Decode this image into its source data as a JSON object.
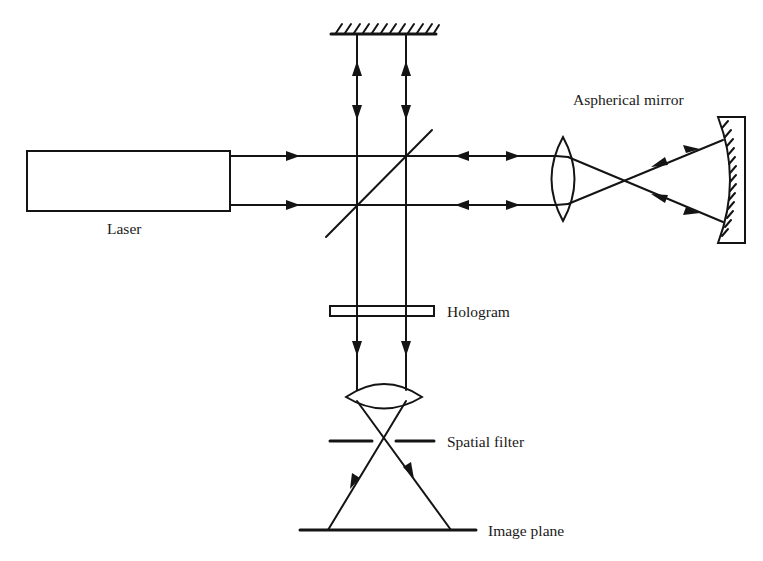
{
  "diagram": {
    "type": "optical-setup",
    "title": "",
    "labels": {
      "laser": "Laser",
      "aspherical_mirror": "Aspherical mirror",
      "hologram": "Hologram",
      "spatial_filter": "Spatial filter",
      "image_plane": "Image plane"
    },
    "components": [
      {
        "id": "laser",
        "label": "Laser",
        "kind": "light-source"
      },
      {
        "id": "plane-mirror",
        "label": "",
        "kind": "flat-mirror"
      },
      {
        "id": "beam-splitter",
        "label": "",
        "kind": "beam-splitter"
      },
      {
        "id": "lens-1",
        "label": "",
        "kind": "converging-lens"
      },
      {
        "id": "aspherical-mirror",
        "label": "Aspherical mirror",
        "kind": "concave-mirror"
      },
      {
        "id": "hologram",
        "label": "Hologram",
        "kind": "plate"
      },
      {
        "id": "lens-2",
        "label": "",
        "kind": "converging-lens"
      },
      {
        "id": "spatial-filter",
        "label": "Spatial filter",
        "kind": "aperture"
      },
      {
        "id": "image-plane",
        "label": "Image plane",
        "kind": "screen"
      }
    ],
    "colors": {
      "ink": "#141414",
      "background": "#ffffff"
    }
  }
}
